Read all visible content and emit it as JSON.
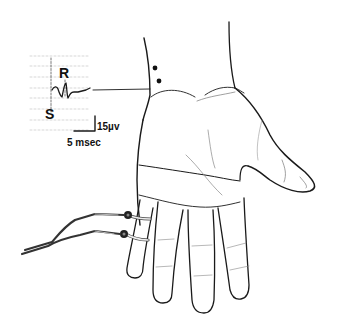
{
  "figure": {
    "trace": {
      "peak_labels": {
        "r": "R",
        "s": "S"
      },
      "scale_bar": {
        "amplitude": "15µv",
        "time": "5 msec"
      }
    },
    "colors": {
      "line": "#1a1a1a",
      "grid": "#bdbdbd",
      "background": "#ffffff"
    }
  }
}
